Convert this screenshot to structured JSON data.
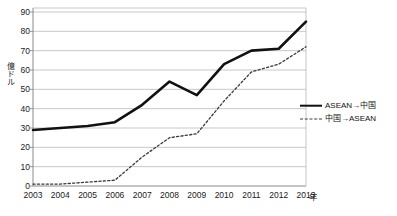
{
  "chart_data": {
    "type": "line",
    "title": "",
    "xlabel": "年",
    "ylabel": "億ドル",
    "ylim": [
      0,
      90
    ],
    "ytick_step": 10,
    "yticks": [
      "0",
      "10",
      "20",
      "30",
      "40",
      "50",
      "60",
      "70",
      "80",
      "90"
    ],
    "grid": true,
    "legend_position": "right",
    "categories": [
      "2003",
      "2004",
      "2005",
      "2006",
      "2007",
      "2008",
      "2009",
      "2010",
      "2011",
      "2012",
      "2013"
    ],
    "series": [
      {
        "name": "ASEAN→中国",
        "style": "solid",
        "color": "#111111",
        "values": [
          29,
          30,
          31,
          33,
          42,
          54,
          47,
          63,
          70,
          71,
          85
        ]
      },
      {
        "name": "中国→ASEAN",
        "style": "dashed",
        "color": "#3a3a3a",
        "values": [
          1,
          1,
          2,
          3,
          15,
          25,
          27,
          44,
          59,
          63,
          72
        ]
      }
    ]
  },
  "axes": {
    "y_title": "億ドル",
    "x_title": "年"
  },
  "legend": {
    "items": [
      {
        "label": "ASEAN→中国",
        "style": "solid"
      },
      {
        "label": "中国→ASEAN",
        "style": "dashed"
      }
    ]
  },
  "colors": {
    "series_solid": "#111111",
    "series_dashed": "#3a3a3a",
    "grid": "#b9b9b9",
    "axis": "#8a8a8a",
    "text": "#1a1a1a"
  }
}
